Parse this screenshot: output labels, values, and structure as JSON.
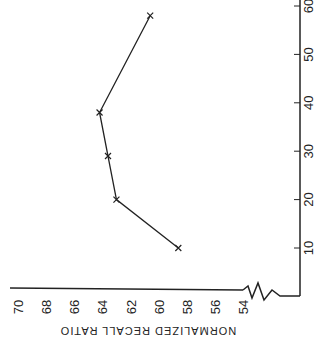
{
  "chart_data": {
    "type": "line",
    "orientation": "rotated-90-clockwise",
    "title": "",
    "xlabel": "",
    "ylabel": "NORMALIZED RECALL RATIO",
    "x": [
      10,
      20,
      29,
      38,
      58
    ],
    "series": [
      {
        "name": "recall",
        "values": [
          58.6,
          63.0,
          63.6,
          64.2,
          60.6
        ],
        "marker": "x"
      }
    ],
    "xticks": [
      10,
      20,
      30,
      40,
      50,
      60
    ],
    "yticks": [
      54,
      56,
      58,
      60,
      62,
      64,
      66,
      68,
      70
    ],
    "xlim": [
      0,
      62
    ],
    "ylim": [
      54,
      70
    ],
    "y_axis_break": true,
    "grid": false,
    "legend": "none"
  },
  "labels": {
    "ylabel": "NORMALIZED RECALL RATIO",
    "xticks": [
      "10",
      "20",
      "30",
      "40",
      "50",
      "60"
    ],
    "yticks": [
      "54",
      "56",
      "58",
      "60",
      "62",
      "64",
      "66",
      "68",
      "70"
    ]
  },
  "colors": {
    "line": "#222222",
    "background": "#ffffff"
  }
}
